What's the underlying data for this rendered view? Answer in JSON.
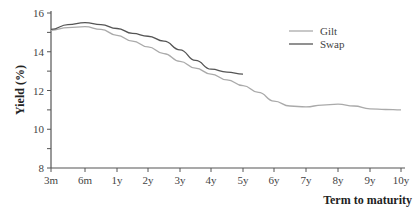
{
  "chart_data": {
    "type": "line",
    "title": "",
    "xlabel": "Term to maturity",
    "ylabel": "Yield (%)",
    "categories": [
      "3m",
      "6m",
      "1y",
      "2y",
      "3y",
      "4y",
      "5y",
      "6y",
      "7y",
      "8y",
      "9y",
      "10y"
    ],
    "yticks": [
      8,
      10,
      12,
      14,
      16
    ],
    "ylim": [
      8,
      16
    ],
    "grid": false,
    "legend_position": "top-right",
    "series": [
      {
        "name": "Gilt",
        "color": "#aaaaaa",
        "points": [
          [
            0,
            15.1
          ],
          [
            0.5,
            15.25
          ],
          [
            1,
            15.3
          ],
          [
            1.5,
            15.15
          ],
          [
            2,
            14.85
          ],
          [
            2.5,
            14.55
          ],
          [
            3,
            14.25
          ],
          [
            3.5,
            13.9
          ],
          [
            4,
            13.5
          ],
          [
            4.5,
            13.15
          ],
          [
            5,
            12.85
          ],
          [
            5.5,
            12.55
          ],
          [
            6,
            12.25
          ],
          [
            6.5,
            11.9
          ],
          [
            7,
            11.45
          ],
          [
            7.5,
            11.2
          ],
          [
            8,
            11.15
          ],
          [
            8.5,
            11.25
          ],
          [
            9,
            11.3
          ],
          [
            9.5,
            11.2
          ],
          [
            10,
            11.05
          ],
          [
            10.5,
            11.02
          ],
          [
            11,
            11.0
          ]
        ]
      },
      {
        "name": "Swap",
        "color": "#555555",
        "points": [
          [
            0,
            15.15
          ],
          [
            0.5,
            15.4
          ],
          [
            1,
            15.5
          ],
          [
            1.5,
            15.4
          ],
          [
            2,
            15.2
          ],
          [
            2.5,
            14.95
          ],
          [
            3,
            14.8
          ],
          [
            3.5,
            14.55
          ],
          [
            4,
            14.1
          ],
          [
            4.5,
            13.55
          ],
          [
            5,
            13.1
          ],
          [
            5.5,
            12.95
          ],
          [
            6,
            12.85
          ]
        ]
      }
    ]
  }
}
